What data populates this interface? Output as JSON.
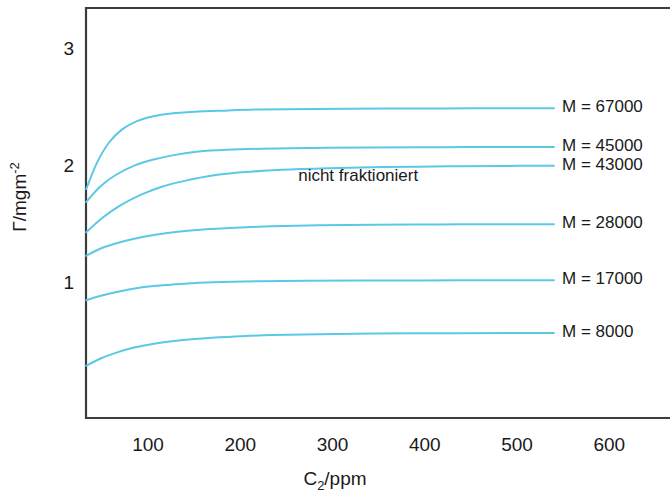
{
  "chart_data": {
    "type": "line",
    "title": "",
    "xlabel": "C2/ppm",
    "xlabel_base": "C",
    "xlabel_sub": "2",
    "xlabel_rest": "/ppm",
    "ylabel": "Γ/mgm-2",
    "ylabel_base": "Γ/mgm",
    "ylabel_sup": "-2",
    "xlim": [
      33,
      670
    ],
    "ylim": [
      0,
      3.5
    ],
    "xticks": [
      100,
      200,
      300,
      400,
      500,
      600
    ],
    "ytick_labels": [
      "1",
      "2",
      "3"
    ],
    "yticks": [
      1,
      2,
      3
    ],
    "grid": false,
    "legend_position": "right-inline",
    "line_color": "#5BC9E5",
    "axis_color": "#3c3c3c",
    "annotations": [
      {
        "text": "nicht fraktioniert",
        "x": 330,
        "y": 1.92
      }
    ],
    "series": [
      {
        "name": "M = 67000",
        "label": "M = 67000",
        "plateau": 2.51,
        "y_start": 1.82,
        "label_y": 2.51,
        "points": [
          [
            33,
            1.82
          ],
          [
            45,
            2.05
          ],
          [
            58,
            2.22
          ],
          [
            72,
            2.33
          ],
          [
            88,
            2.4
          ],
          [
            105,
            2.44
          ],
          [
            125,
            2.465
          ],
          [
            150,
            2.48
          ],
          [
            180,
            2.49
          ],
          [
            220,
            2.5
          ],
          [
            280,
            2.505
          ],
          [
            360,
            2.508
          ],
          [
            450,
            2.51
          ],
          [
            540,
            2.51
          ]
        ]
      },
      {
        "name": "M = 45000",
        "label": "M = 45000",
        "plateau": 2.18,
        "y_start": 1.71,
        "label_y": 2.18,
        "points": [
          [
            33,
            1.71
          ],
          [
            48,
            1.84
          ],
          [
            65,
            1.94
          ],
          [
            85,
            2.02
          ],
          [
            105,
            2.07
          ],
          [
            128,
            2.11
          ],
          [
            155,
            2.14
          ],
          [
            185,
            2.155
          ],
          [
            225,
            2.165
          ],
          [
            280,
            2.172
          ],
          [
            340,
            2.176
          ],
          [
            420,
            2.178
          ],
          [
            500,
            2.18
          ],
          [
            540,
            2.18
          ]
        ]
      },
      {
        "name": "M = 43000",
        "label": "M = 43000",
        "plateau": 2.02,
        "y_start": 1.45,
        "label_y": 2.02,
        "points": [
          [
            33,
            1.45
          ],
          [
            50,
            1.57
          ],
          [
            70,
            1.68
          ],
          [
            92,
            1.77
          ],
          [
            115,
            1.84
          ],
          [
            140,
            1.89
          ],
          [
            170,
            1.935
          ],
          [
            205,
            1.965
          ],
          [
            245,
            1.985
          ],
          [
            295,
            1.998
          ],
          [
            355,
            2.008
          ],
          [
            425,
            2.014
          ],
          [
            490,
            2.018
          ],
          [
            540,
            2.02
          ]
        ]
      },
      {
        "name": "M = 28000",
        "label": "M = 28000",
        "plateau": 1.52,
        "y_start": 1.25,
        "label_y": 1.52,
        "points": [
          [
            33,
            1.25
          ],
          [
            48,
            1.31
          ],
          [
            65,
            1.355
          ],
          [
            85,
            1.395
          ],
          [
            108,
            1.43
          ],
          [
            132,
            1.455
          ],
          [
            160,
            1.475
          ],
          [
            195,
            1.49
          ],
          [
            235,
            1.502
          ],
          [
            285,
            1.51
          ],
          [
            345,
            1.515
          ],
          [
            420,
            1.518
          ],
          [
            490,
            1.52
          ],
          [
            540,
            1.52
          ]
        ]
      },
      {
        "name": "M = 17000",
        "label": "M = 17000",
        "plateau": 1.04,
        "y_start": 0.87,
        "label_y": 1.04,
        "points": [
          [
            33,
            0.87
          ],
          [
            45,
            0.9
          ],
          [
            60,
            0.93
          ],
          [
            78,
            0.96
          ],
          [
            98,
            0.985
          ],
          [
            120,
            1.0
          ],
          [
            148,
            1.015
          ],
          [
            180,
            1.025
          ],
          [
            220,
            1.032
          ],
          [
            270,
            1.036
          ],
          [
            330,
            1.038
          ],
          [
            400,
            1.039
          ],
          [
            470,
            1.04
          ],
          [
            540,
            1.04
          ]
        ]
      },
      {
        "name": "M = 8000",
        "label": "M = 8000",
        "plateau": 0.59,
        "y_start": 0.31,
        "label_y": 0.59,
        "points": [
          [
            33,
            0.31
          ],
          [
            48,
            0.37
          ],
          [
            65,
            0.42
          ],
          [
            85,
            0.465
          ],
          [
            108,
            0.5
          ],
          [
            133,
            0.525
          ],
          [
            162,
            0.545
          ],
          [
            195,
            0.56
          ],
          [
            235,
            0.572
          ],
          [
            285,
            0.58
          ],
          [
            345,
            0.585
          ],
          [
            420,
            0.588
          ],
          [
            490,
            0.59
          ],
          [
            540,
            0.59
          ]
        ]
      }
    ]
  }
}
